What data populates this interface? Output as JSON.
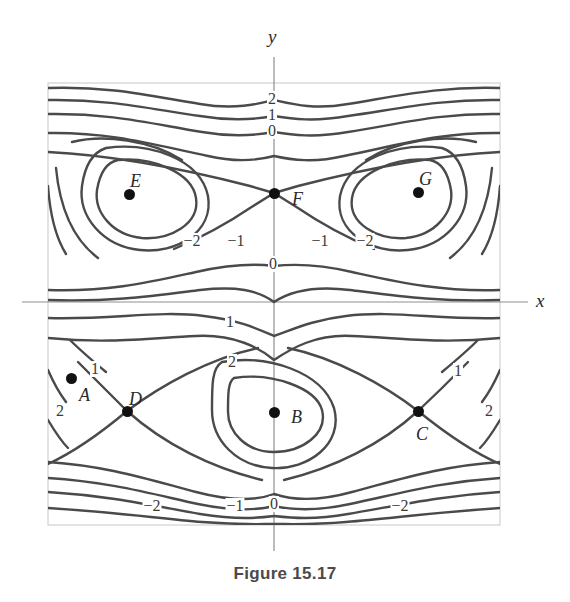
{
  "page": {
    "top_partial_text": "",
    "caption": "Figure 15.17",
    "background_color": "#ffffff",
    "curve_color": "#4a4a4a",
    "axis_color": "#9a9a9a",
    "frame_color": "#c8c8c8",
    "text_color": "#2a2a2a"
  },
  "chart_data": {
    "type": "contour",
    "title": "Figure 15.17",
    "xlabel": "x",
    "ylabel": "y",
    "grid": false,
    "legend": "none",
    "xlim": [
      -3.3,
      3.3
    ],
    "ylim": [
      -3.3,
      3.3
    ],
    "contour_levels": [
      -2,
      -1,
      0,
      1,
      2
    ],
    "marked_points": [
      {
        "name": "A",
        "label": "A",
        "x": 71,
        "y": 378,
        "label_dx": 8,
        "label_dy": 18
      },
      {
        "name": "B",
        "label": "B",
        "x": 274,
        "y": 412,
        "label_dx": 17,
        "label_dy": 6
      },
      {
        "name": "C",
        "label": "C",
        "x": 418,
        "y": 411,
        "label_dx": -2,
        "label_dy": 24
      },
      {
        "name": "D",
        "label": "D",
        "x": 127,
        "y": 411,
        "label_dx": 2,
        "label_dy": -11
      },
      {
        "name": "E",
        "label": "E",
        "x": 129,
        "y": 194,
        "label_dx": 1,
        "label_dy": -12
      },
      {
        "name": "F",
        "label": "F",
        "x": 274,
        "y": 193,
        "label_dx": 18,
        "label_dy": 7
      },
      {
        "name": "G",
        "label": "G",
        "x": 418,
        "y": 192,
        "label_dx": 1,
        "label_dy": -12
      }
    ],
    "contour_labels": [
      {
        "text": "2",
        "x": 272,
        "y": 100
      },
      {
        "text": "1",
        "x": 272,
        "y": 116
      },
      {
        "text": "0",
        "x": 272,
        "y": 132
      },
      {
        "text": "−2",
        "x": 192,
        "y": 242
      },
      {
        "text": "−1",
        "x": 236,
        "y": 242
      },
      {
        "text": "−1",
        "x": 320,
        "y": 242
      },
      {
        "text": "−2",
        "x": 365,
        "y": 242
      },
      {
        "text": "0",
        "x": 273,
        "y": 265
      },
      {
        "text": "1",
        "x": 230,
        "y": 323
      },
      {
        "text": "2",
        "x": 232,
        "y": 363
      },
      {
        "text": "1",
        "x": 95,
        "y": 370
      },
      {
        "text": "2",
        "x": 60,
        "y": 412
      },
      {
        "text": "1",
        "x": 458,
        "y": 372
      },
      {
        "text": "2",
        "x": 489,
        "y": 412
      },
      {
        "text": "−2",
        "x": 152,
        "y": 507
      },
      {
        "text": "−1",
        "x": 235,
        "y": 507
      },
      {
        "text": "0",
        "x": 274,
        "y": 505
      },
      {
        "text": "−2",
        "x": 400,
        "y": 507
      }
    ],
    "axes": {
      "x_axis_label": "x",
      "x_axis_label_pos": {
        "x": 540,
        "y": 294
      },
      "y_axis_label": "y",
      "y_axis_label_pos": {
        "x": 268,
        "y": 36
      },
      "x_axis_y_pixel": 302,
      "y_axis_x_pixel": 274
    },
    "frame": {
      "left": 48,
      "top": 83,
      "right": 500,
      "bottom": 525
    }
  }
}
